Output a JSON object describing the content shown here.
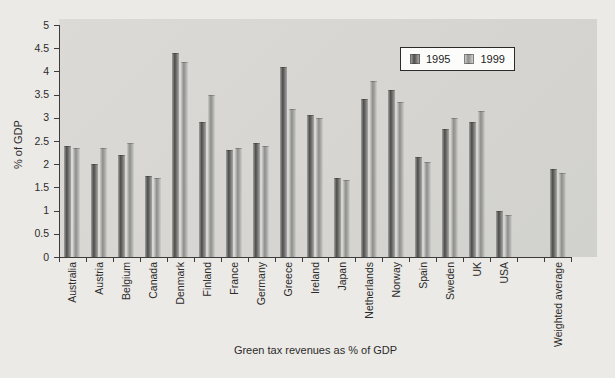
{
  "chart_data": {
    "type": "bar",
    "title": "",
    "xlabel": "Green tax revenues as % of GDP",
    "ylabel": "% of GDP",
    "ylim": [
      0,
      5
    ],
    "ytick_step": 0.5,
    "ytick_labels": [
      "0",
      "0.5",
      "1",
      "1.5",
      "2",
      "2.5",
      "3",
      "3.5",
      "4",
      "4.5",
      "5"
    ],
    "grid": false,
    "legend_position": "inside-top-center",
    "categories": [
      "Australia",
      "Austria",
      "Belgium",
      "Canada",
      "Denmark",
      "Finland",
      "France",
      "Germany",
      "Greece",
      "Ireland",
      "Japan",
      "Netherlands",
      "Norway",
      "Spain",
      "Sweden",
      "UK",
      "USA",
      "",
      "Weighted average"
    ],
    "series": [
      {
        "name": "1995",
        "values": [
          2.4,
          2.0,
          2.2,
          1.75,
          4.4,
          2.9,
          2.3,
          2.45,
          4.1,
          3.05,
          1.7,
          3.4,
          3.6,
          2.15,
          2.75,
          2.9,
          1.0,
          null,
          1.9
        ]
      },
      {
        "name": "1999",
        "values": [
          2.35,
          2.35,
          2.45,
          1.7,
          4.2,
          3.5,
          2.35,
          2.4,
          3.2,
          3.0,
          1.65,
          3.8,
          3.35,
          2.05,
          3.0,
          3.15,
          0.9,
          null,
          1.8
        ]
      }
    ]
  },
  "colors": {
    "page_bg": "#ebeae6",
    "plot_bg": "#d6d5d1",
    "axis": "#3c3c3a",
    "text": "#2b2b2b",
    "legend_bg": "#fcfcfa",
    "legend_border": "#2b2b2b",
    "series": [
      {
        "name": "1995",
        "gradient": [
          "#a0a09e",
          "#4e4e4c",
          "#686866",
          "#a8a8a6"
        ]
      },
      {
        "name": "1999",
        "gradient": [
          "#cbcbc8",
          "#8f8f8d",
          "#9e9e9c",
          "#cfcfcc"
        ]
      }
    ]
  }
}
